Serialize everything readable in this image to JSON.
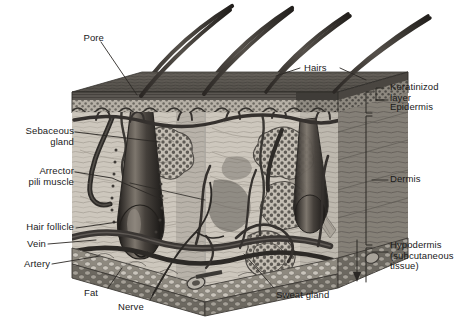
{
  "figure": {
    "type": "anatomical-illustration",
    "style": "grayscale halftone engraving",
    "palette": {
      "background": "#ffffff",
      "ink": "#1a1a1a",
      "leader_line": "#333333",
      "epidermis_top": "#5e5e5e",
      "keratinized": "#4a4a4a",
      "dermis_light": "#cfcac2",
      "dermis_mid": "#9a948c",
      "gland": "#8d8d8d",
      "fat": "#b8b4ae",
      "hair": "#3a3632"
    }
  },
  "labels": {
    "pore": "Pore",
    "hairs": "Hairs",
    "keratinized_layer": "Keratinizod\nlayer",
    "epidermis": "Epidermis",
    "dermis": "Dermis",
    "hypodermis": "Hypodermis\n(subcutaneous\ntissue)",
    "sebaceous_gland": "Sebaceous\ngland",
    "arrector_pili": "Arrector\npili muscle",
    "hair_follicle": "Hair follicle",
    "vein": "Vein",
    "artery": "Artery",
    "fat": "Fat",
    "nerve": "Nerve",
    "sweat_gland": "Sweat gland"
  },
  "structures": [
    {
      "name": "pore",
      "side": "left",
      "label": "Pore"
    },
    {
      "name": "hairs",
      "side": "top-right",
      "label": "Hairs",
      "count": 4
    },
    {
      "name": "keratinized-layer",
      "side": "right",
      "label": "Keratinizod layer"
    },
    {
      "name": "epidermis",
      "side": "right",
      "label": "Epidermis"
    },
    {
      "name": "dermis",
      "side": "right",
      "label": "Dermis"
    },
    {
      "name": "hypodermis",
      "side": "right",
      "label": "Hypodermis (subcutaneous tissue)"
    },
    {
      "name": "sebaceous-gland",
      "side": "left",
      "label": "Sebaceous gland"
    },
    {
      "name": "arrector-pili-muscle",
      "side": "left",
      "label": "Arrector pili muscle"
    },
    {
      "name": "hair-follicle",
      "side": "left",
      "label": "Hair follicle"
    },
    {
      "name": "vein",
      "side": "left",
      "label": "Vein"
    },
    {
      "name": "artery",
      "side": "left",
      "label": "Artery"
    },
    {
      "name": "fat",
      "side": "bottom",
      "label": "Fat"
    },
    {
      "name": "nerve",
      "side": "bottom",
      "label": "Nerve"
    },
    {
      "name": "sweat-gland",
      "side": "bottom-right",
      "label": "Sweat gland"
    }
  ]
}
